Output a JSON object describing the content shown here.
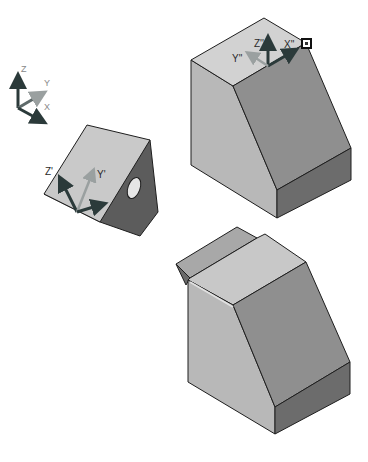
{
  "figure": {
    "colors": {
      "background": "#ffffff",
      "face_light": "#cfcfcf",
      "face_mid": "#b5b5b5",
      "face_dark": "#8c8c8c",
      "face_darker": "#6e6e6e",
      "face_wedge_dark": "#5c5c5c",
      "edge": "#1e1e1e",
      "axis_dark": "#2b3a3a",
      "axis_light": "#9aa0a0"
    }
  },
  "world_triad": {
    "labels": {
      "z": "Z",
      "y": "Y",
      "x": "X"
    }
  },
  "wedge_part": {
    "labels": {
      "z": "Z'",
      "y": "Y'"
    }
  },
  "upper_block": {
    "labels": {
      "z": "Z''",
      "x": "X''",
      "y": "Y''"
    },
    "marker": "selected-vertex-marker"
  },
  "lower_block": {
    "caption": ""
  }
}
